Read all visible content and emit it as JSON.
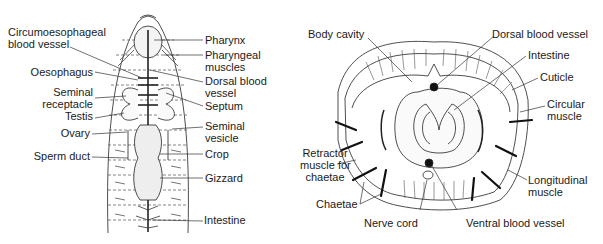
{
  "figure": {
    "left_panel": {
      "name": "Earthworm anterior dissection (dorsal view)",
      "labels_left": [
        {
          "line1": "Circumoesophageal",
          "line2": "blood vessel"
        },
        {
          "line1": "Oesophagus"
        },
        {
          "line1": "Seminal",
          "line2": "receptacle"
        },
        {
          "line1": "Testis"
        },
        {
          "line1": "Ovary"
        },
        {
          "line1": "Sperm duct"
        }
      ],
      "labels_right": [
        {
          "line1": "Pharynx"
        },
        {
          "line1": "Pharyngeal",
          "line2": "muscles"
        },
        {
          "line1": "Dorsal blood",
          "line2": "vessel"
        },
        {
          "line1": "Septum"
        },
        {
          "line1": "Seminal",
          "line2": "vesicle"
        },
        {
          "line1": "Crop"
        },
        {
          "line1": "Gizzard"
        },
        {
          "line1": "Intestine"
        }
      ]
    },
    "right_panel": {
      "name": "Earthworm transverse section",
      "labels": {
        "body_cavity": "Body cavity",
        "dorsal_blood_vessel": "Dorsal blood vessel",
        "intestine": "Intestine",
        "cuticle": "Cuticle",
        "circular_muscle_1": "Circular",
        "circular_muscle_2": "muscle",
        "retractor_1": "Retractor",
        "retractor_2": "muscle for",
        "retractor_3": "chaetae",
        "longitudinal_1": "Longitudinal",
        "longitudinal_2": "muscle",
        "chaetae": "Chaetae",
        "nerve_cord": "Nerve cord",
        "ventral_blood_vessel": "Ventral blood vessel"
      }
    }
  }
}
